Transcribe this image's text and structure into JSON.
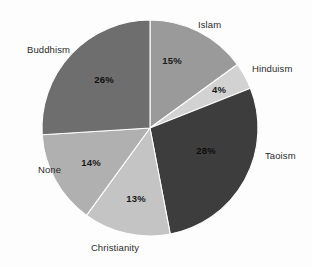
{
  "chart_data": {
    "type": "pie",
    "title": "",
    "subtitle": "",
    "xlabel": "",
    "ylabel": "",
    "legend_position": "none",
    "grid": false,
    "start_angle_deg": 0,
    "direction": "clockwise",
    "categories": [
      "Islam",
      "Hinduism",
      "Taoism",
      "Christianity",
      "None",
      "Buddhism"
    ],
    "values": [
      15,
      4,
      28,
      13,
      14,
      26
    ],
    "value_labels": [
      "15%",
      "4%",
      "28%",
      "13%",
      "14%",
      "26%"
    ],
    "units": "percent",
    "total": 100,
    "colors": [
      "#9a9a9a",
      "#d2d2d2",
      "#3d3d3d",
      "#c4c4c4",
      "#b0b0b0",
      "#6e6e6e"
    ],
    "slices": [
      {
        "label": "Islam",
        "value": 15,
        "value_label": "15%",
        "color": "#9a9a9a",
        "pct_x": 172,
        "pct_y": 61,
        "cat_x": 198,
        "cat_y": 25,
        "cat_anchor": "start"
      },
      {
        "label": "Hinduism",
        "value": 4,
        "value_label": "4%",
        "color": "#d2d2d2",
        "pct_x": 219,
        "pct_y": 90,
        "cat_x": 252,
        "cat_y": 69,
        "cat_anchor": "start"
      },
      {
        "label": "Taoism",
        "value": 28,
        "value_label": "28%",
        "color": "#3d3d3d",
        "pct_x": 206,
        "pct_y": 151,
        "cat_x": 265,
        "cat_y": 156,
        "cat_anchor": "start"
      },
      {
        "label": "Christianity",
        "value": 13,
        "value_label": "13%",
        "color": "#c4c4c4",
        "pct_x": 136,
        "pct_y": 199,
        "cat_x": 115,
        "cat_y": 248,
        "cat_anchor": "middle"
      },
      {
        "label": "None",
        "value": 14,
        "value_label": "14%",
        "color": "#b0b0b0",
        "pct_x": 91,
        "pct_y": 163,
        "cat_x": 38,
        "cat_y": 170,
        "cat_anchor": "start"
      },
      {
        "label": "Buddhism",
        "value": 26,
        "value_label": "26%",
        "color": "#6e6e6e",
        "pct_x": 104,
        "pct_y": 80,
        "cat_x": 27,
        "cat_y": 50,
        "cat_anchor": "start"
      }
    ],
    "geometry": {
      "cx": 150,
      "cy": 128,
      "r": 108
    }
  }
}
